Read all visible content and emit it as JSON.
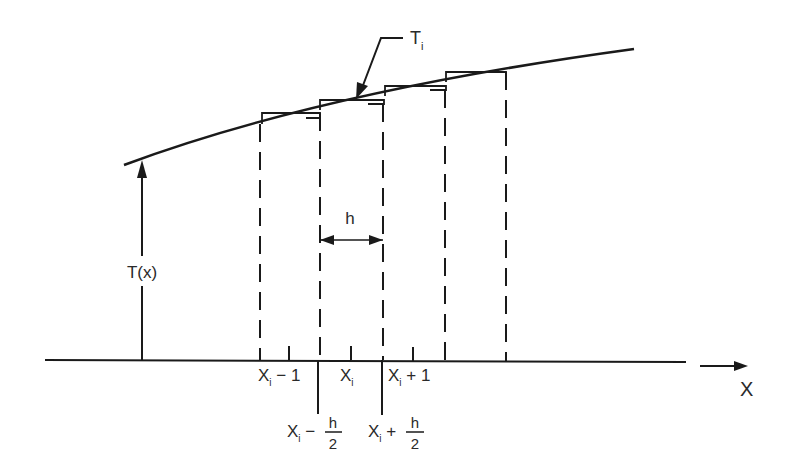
{
  "diagram": {
    "type": "finite-difference discretization of continuous function",
    "colors": {
      "ink": "#1a1a1a",
      "background": "#ffffff"
    },
    "curve": {
      "label": "T",
      "label_subscript": "i",
      "description": "continuous curve T(x) with piecewise-constant step approximation T_i over cells of width h"
    },
    "function_label": "T(x)",
    "axis_label": "X",
    "spacing_label": "h",
    "node_labels": [
      {
        "base": "X",
        "sub": "i",
        "suffix": " − 1"
      },
      {
        "base": "X",
        "sub": "i",
        "suffix": ""
      },
      {
        "base": "X",
        "sub": "i",
        "suffix": " + 1"
      }
    ],
    "face_labels": [
      {
        "base": "X",
        "sub": "i",
        "op": " − ",
        "num": "h",
        "den": "2"
      },
      {
        "base": "X",
        "sub": "i",
        "op": " + ",
        "num": "h",
        "den": "2"
      }
    ]
  }
}
